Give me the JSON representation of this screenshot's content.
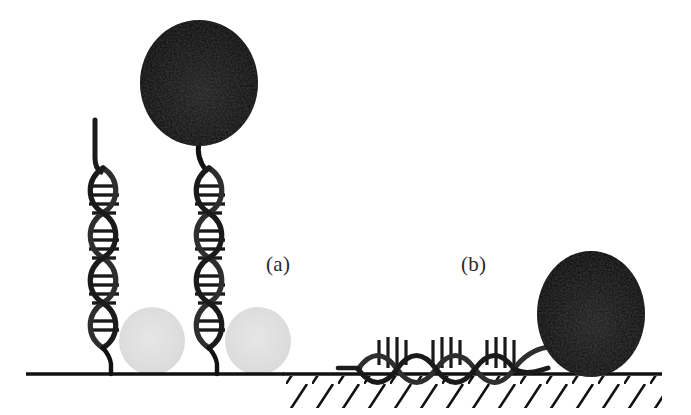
{
  "figure": {
    "caption_labels": {
      "panel_a": "(a)",
      "panel_b": "(b)"
    },
    "background_color": "#ffffff",
    "width": 691,
    "height": 415
  },
  "colors": {
    "stroke_dark": "#111111",
    "helix_strand": "#2e2e2e",
    "sphere_black": "#0a0a0a",
    "sphere_gray": "#dedede",
    "baseline": "#111111",
    "hatch": "#111111",
    "label_text": "#2a2a2a"
  },
  "panel_a": {
    "label": "(a)",
    "baseline": {
      "x1": 26,
      "x2": 282,
      "y": 374,
      "thickness": 3,
      "hatched": false
    },
    "black_sphere": {
      "cx": 199,
      "cy": 83,
      "rx": 59,
      "ry": 63,
      "label": "black-bead"
    },
    "gray_spheres": [
      {
        "cx": 152,
        "cy": 341,
        "rx": 33,
        "ry": 34,
        "label": "gray-bead-left"
      },
      {
        "cx": 258,
        "cy": 341,
        "rx": 33,
        "ry": 34,
        "label": "gray-bead-right"
      }
    ],
    "helices": [
      {
        "name": "dna-helix-free",
        "x_center": 103,
        "top": 168,
        "bottom": 347,
        "amplitude": 16,
        "period": 45,
        "turns": 4,
        "anchor_x": 111,
        "anchor_bottom": 374,
        "free_tail": {
          "x": 94,
          "y_top": 118,
          "y_bottom": 170
        },
        "has_bead": false
      },
      {
        "name": "dna-helix-bead",
        "x_center": 209,
        "top": 168,
        "bottom": 347,
        "amplitude": 16,
        "period": 45,
        "turns": 4,
        "anchor_x": 217,
        "anchor_bottom": 374,
        "tether": {
          "x_top": 201,
          "y_top": 146,
          "x_bottom": 205,
          "y_bottom": 172
        },
        "has_bead": true
      }
    ]
  },
  "panel_b": {
    "label": "(b)",
    "baseline": {
      "x1": 283,
      "x2": 662,
      "y": 374,
      "thickness": 3,
      "hatched": true
    },
    "hatching": {
      "x_start": 286,
      "x_end": 660,
      "spacing": 26,
      "length": 30,
      "angle_deg": 55
    },
    "black_sphere": {
      "cx": 591,
      "cy": 314,
      "rx": 54,
      "ry": 63,
      "label": "black-bead"
    },
    "helix": {
      "name": "dna-helix-adsorbed",
      "y_center": 352,
      "x_start": 358,
      "x_end": 548,
      "amplitude": 18,
      "period": 54,
      "turns": 3.5,
      "orientation": "horizontal"
    }
  }
}
